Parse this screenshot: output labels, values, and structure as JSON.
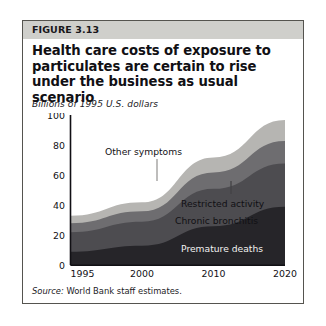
{
  "figure": {
    "number_label": "FIGURE 3.13",
    "title": "Health care costs of exposure to particulates are certain to rise under the business as usual scenario",
    "subtitle": "Billions of 1995 U.S. dollars",
    "source_prefix": "Source:",
    "source_text": " World Bank staff estimates."
  },
  "colors": {
    "header_band": "#cfcfcb",
    "border": "#55544f",
    "premature_deaths": "#262529",
    "chronic_bronchitis": "#4d4c50",
    "restricted_activity": "#6e6d70",
    "other_symptoms": "#b6b5b2",
    "axis": "#111014",
    "page_background": "#ffffff"
  },
  "chart_data": {
    "type": "area",
    "stacked": true,
    "title": "Health care costs of exposure to particulates are certain to rise under the business as usual scenario",
    "xlabel": "",
    "ylabel": "Billions of 1995 U.S. dollars",
    "ylim": [
      0,
      100
    ],
    "ytick_labels": [
      "0",
      "20",
      "40",
      "60",
      "80",
      "100"
    ],
    "yticks": [
      0,
      20,
      40,
      60,
      80,
      100
    ],
    "xtick_labels": [
      "1995",
      "2000",
      "2010",
      "2020"
    ],
    "xticks": [
      1995,
      2000,
      2010,
      2020
    ],
    "x": [
      1995,
      2000,
      2010,
      2020
    ],
    "grid": false,
    "legend_position": "inline-annotations",
    "series": [
      {
        "name": "Premature deaths",
        "values": [
          9,
          13,
          26,
          39
        ]
      },
      {
        "name": "Chronic bronchitis",
        "values": [
          13,
          16,
          25,
          29
        ]
      },
      {
        "name": "Restricted activity",
        "values": [
          6,
          7,
          11,
          15
        ]
      },
      {
        "name": "Other symptoms",
        "values": [
          5,
          6,
          10,
          14
        ]
      }
    ],
    "stack_totals": [
      33,
      42,
      72,
      97
    ],
    "annotations": [
      {
        "text": "Other symptoms",
        "leader": true
      },
      {
        "text": "Restricted activity",
        "leader": true
      },
      {
        "text": "Chronic bronchitis",
        "leader": false
      },
      {
        "text": "Premature deaths",
        "leader": false
      }
    ]
  }
}
